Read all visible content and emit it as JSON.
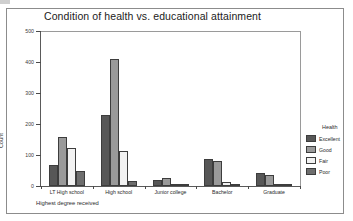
{
  "figure": {
    "title": "Condition of health vs. educational attainment",
    "y_axis_label": "Count",
    "x_axis_label": "Highest degree received"
  },
  "legend": {
    "title": "Health",
    "entries": [
      {
        "label": "Excellent",
        "color": "#575757"
      },
      {
        "label": "Good",
        "color": "#9a9a9a"
      },
      {
        "label": "Fair",
        "color": "#f2f2f2"
      },
      {
        "label": "Poor",
        "color": "#6e6e6e"
      }
    ]
  },
  "chart_data": {
    "type": "bar",
    "title": "Condition of health vs. educational attainment",
    "xlabel": "Highest degree received",
    "ylabel": "Count",
    "ylim": [
      0,
      500
    ],
    "yticks": [
      0,
      100,
      200,
      300,
      400,
      500
    ],
    "grid": false,
    "legend_position": "right",
    "legend_title": "Health",
    "categories": [
      "LT High school",
      "High school",
      "Junior college",
      "Bachelor",
      "Graduate"
    ],
    "series": [
      {
        "name": "Excellent",
        "color": "#575757",
        "values": [
          68,
          230,
          20,
          88,
          42
        ]
      },
      {
        "name": "Good",
        "color": "#9a9a9a",
        "values": [
          157,
          410,
          27,
          82,
          37
        ]
      },
      {
        "name": "Fair",
        "color": "#f2f2f2",
        "values": [
          122,
          113,
          8,
          13,
          5
        ]
      },
      {
        "name": "Poor",
        "color": "#6e6e6e",
        "values": [
          50,
          16,
          2,
          3,
          2
        ]
      }
    ]
  }
}
